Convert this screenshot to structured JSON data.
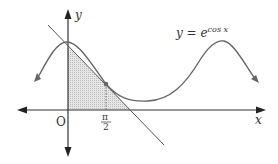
{
  "diagram": {
    "title": "",
    "axis_labels": {
      "x": "x",
      "y": "y"
    },
    "origin_label": "O",
    "tick_label": {
      "numerator": "π",
      "denominator": "2"
    },
    "curve_label": {
      "base": "y = e",
      "exponent": "cos x"
    },
    "colors": {
      "curve": "#666666",
      "axis": "#333333",
      "shade": "#d9d9d9",
      "tangent": "#555555"
    },
    "elements": [
      "curve y = e^{cos x}",
      "tangent line at x = π/2",
      "shaded triangle between tangent line and axes",
      "dotted vertical line at x = π/2"
    ]
  }
}
